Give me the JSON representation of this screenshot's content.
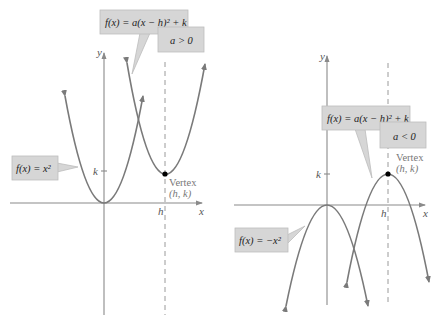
{
  "left_graph": {
    "condition": "a > 0",
    "general_form": "f(x) = a(x − h)² + k",
    "base_function": "f(x) = x²",
    "axis_labels": {
      "x": "x",
      "y": "y"
    },
    "tick_labels": {
      "h": "h",
      "k": "k"
    },
    "vertex": {
      "label": "Vertex",
      "coords": "(h, k)"
    }
  },
  "right_graph": {
    "condition": "a < 0",
    "general_form": "f(x) = a(x − h)² + k",
    "base_function": "f(x) = −x²",
    "axis_labels": {
      "x": "x",
      "y": "y"
    },
    "tick_labels": {
      "h": "h",
      "k": "k"
    },
    "vertex": {
      "label": "Vertex",
      "coords": "(h, k)"
    }
  },
  "colors": {
    "curve": "#7a7a7a",
    "axis": "#8a8a8a",
    "callout_fill": "#d6d6d6",
    "vertex_point": "#000000"
  }
}
